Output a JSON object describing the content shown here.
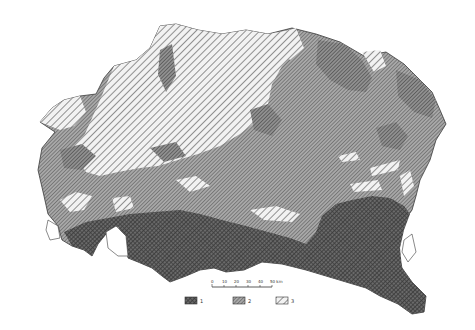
{
  "map": {
    "type": "thematic-hatched-map",
    "colors": {
      "background": "#ffffff",
      "class_1": "#5a5a5a",
      "class_2": "#8c8c8c",
      "class_3": "#d0d0d0",
      "outline": "#3a3a3a"
    },
    "scale_bar": {
      "ticks": [
        "0",
        "10",
        "20",
        "30",
        "40",
        "50 km"
      ]
    },
    "legend": {
      "items": [
        {
          "label": "1",
          "pattern": "dense-crosshatch-dark"
        },
        {
          "label": "2",
          "pattern": "medium-hatch"
        },
        {
          "label": "3",
          "pattern": "wide-diagonal-hatch"
        }
      ]
    }
  }
}
